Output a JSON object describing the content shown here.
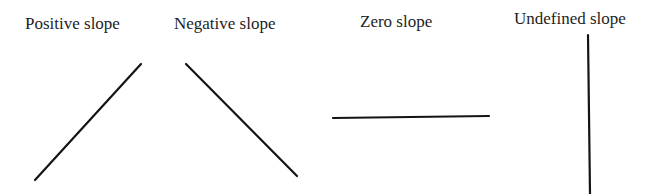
{
  "diagram": {
    "title": "",
    "line_color": "#141414",
    "panels": [
      {
        "label": "Positive slope",
        "kind": "positive",
        "line": {
          "x1": 35,
          "y1": 180,
          "x2": 141,
          "y2": 64
        }
      },
      {
        "label": "Negative slope",
        "kind": "negative",
        "line": {
          "x1": 186,
          "y1": 64,
          "x2": 297,
          "y2": 176
        }
      },
      {
        "label": "Zero slope",
        "kind": "zero",
        "line": {
          "x1": 333,
          "y1": 118,
          "x2": 489,
          "y2": 116
        }
      },
      {
        "label": "Undefined slope",
        "kind": "undefined",
        "line": {
          "x1": 588,
          "y1": 35,
          "x2": 590,
          "y2": 194
        }
      }
    ]
  }
}
